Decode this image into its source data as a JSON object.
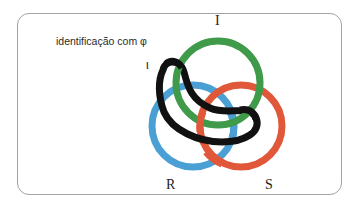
{
  "caption": "identificação com φ",
  "labels": {
    "imaginary": "I",
    "real": "R",
    "symbolic": "S",
    "iota": "ι"
  },
  "colors": {
    "imaginary": "#3f9a4a",
    "real": "#4aa0d5",
    "symbolic": "#e0573a",
    "loop": "#111111",
    "frame": "#a3a3a3"
  },
  "rings": [
    {
      "name": "I",
      "color": "#3f9a4a",
      "cx": 218,
      "cy": 83,
      "r": 42
    },
    {
      "name": "R",
      "color": "#4aa0d5",
      "cx": 193,
      "cy": 126,
      "r": 41
    },
    {
      "name": "S",
      "color": "#e0573a",
      "cx": 241,
      "cy": 126,
      "r": 41
    }
  ]
}
